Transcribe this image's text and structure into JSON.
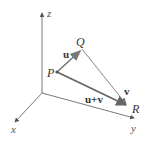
{
  "diagram": {
    "axes": {
      "z_label": "z",
      "x_label": "x",
      "y_label": "y",
      "origin": [
        42,
        93
      ],
      "z_end": [
        42,
        12
      ],
      "x_end": [
        14,
        124
      ],
      "y_end": [
        135,
        119
      ]
    },
    "points": {
      "P": {
        "label": "P",
        "xy": [
          57,
          72
        ]
      },
      "Q": {
        "label": "Q",
        "xy": [
          82,
          49
        ]
      },
      "R": {
        "label": "R",
        "xy": [
          128,
          106
        ]
      }
    },
    "vectors": {
      "u": {
        "label": "u",
        "from": "P",
        "to": "Q"
      },
      "v": {
        "label": "v",
        "from": "Q",
        "to": "R"
      },
      "u_plus_v": {
        "label": "u+v",
        "from": "P",
        "to": "R"
      }
    },
    "colors": {
      "axis": "#555555",
      "vector": "#777777",
      "resultant": "#666666",
      "text": "#333333"
    }
  }
}
